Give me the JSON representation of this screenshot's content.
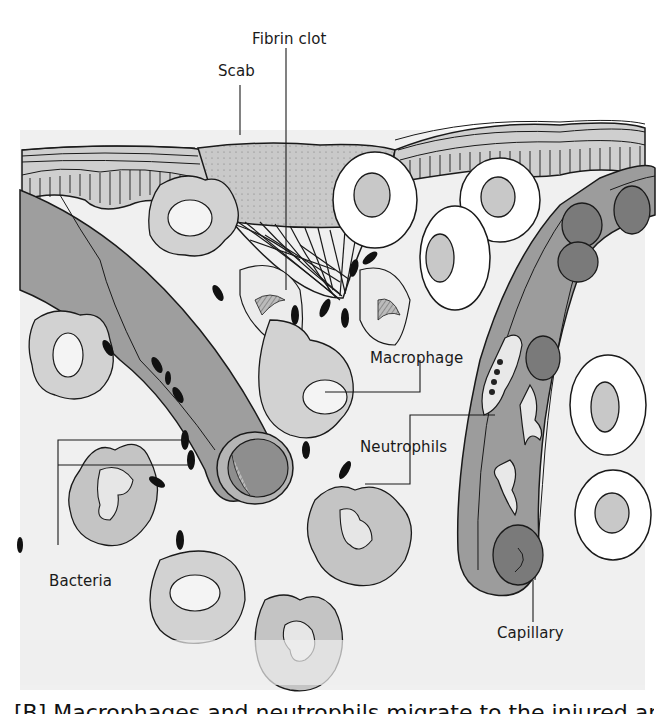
{
  "figure": {
    "type": "anatomical-illustration",
    "labels": {
      "fibrin_clot": "Fibrin clot",
      "scab": "Scab",
      "macrophage": "Macrophage",
      "neutrophils": "Neutrophils",
      "bacteria": "Bacteria",
      "capillary": "Capillary"
    },
    "caption": "[B] Macrophages and neutrophils migrate to the injured area",
    "colors": {
      "background": "#f3f3f3",
      "tissue_light": "#ececec",
      "cell_fill": "#cfcfcf",
      "vessel_fill": "#9c9c9c",
      "vessel_dark": "#7c7c7c",
      "rbc_fill": "#7a7a7a",
      "scab_fill": "#c4c4c4",
      "outline": "#1a1a1a",
      "white_cell": "#ffffff"
    }
  }
}
